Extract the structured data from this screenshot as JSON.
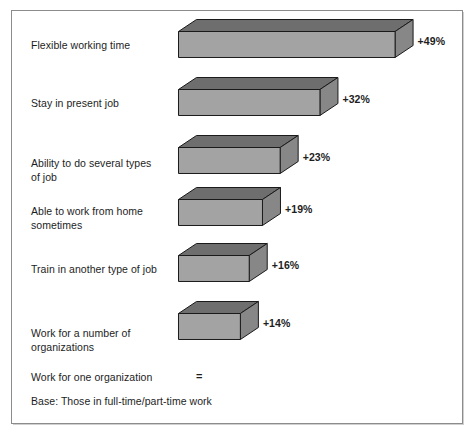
{
  "chart_data": {
    "type": "bar",
    "title": "",
    "subtitle": "",
    "xlabel": "",
    "ylabel": "",
    "orientation": "horizontal",
    "style": "3d-bar",
    "grid": false,
    "legend": null,
    "categories": [
      "Flexible working time",
      "Stay in present job",
      "Ability to do several types of job",
      "Able to work from home sometimes",
      "Train in another type of job",
      "Work for a number of organizations",
      "Work for one organization"
    ],
    "values": [
      49,
      32,
      23,
      19,
      16,
      14,
      0
    ],
    "value_labels": [
      "+49%",
      "+32%",
      "+23%",
      "+19%",
      "+16%",
      "+14%",
      "="
    ],
    "xlim": [
      0,
      49
    ],
    "annotations": [
      "Base: Those in full-time/part-time work"
    ],
    "colors": {
      "bar_front": "#a3a3a3",
      "bar_top": "#6e6e6e",
      "bar_side": "#878787",
      "bar_outline": "#1a1a1a",
      "frame": "#8c8c8c",
      "text": "#1d1d1d",
      "background": "#ffffff"
    }
  },
  "chart": {
    "base_note": "Base: Those in full-time/part-time work",
    "rows": [
      {
        "label": "Flexible working time",
        "label_lines": [
          "Flexible working time"
        ],
        "value_label": "+49%",
        "value": 49,
        "has_bar": true
      },
      {
        "label": "Stay in present job",
        "label_lines": [
          "Stay in present job"
        ],
        "value_label": "+32%",
        "value": 32,
        "has_bar": true
      },
      {
        "label": "Ability to do several types of job",
        "label_lines": [
          "Ability to do several types",
          "of job"
        ],
        "value_label": "+23%",
        "value": 23,
        "has_bar": true
      },
      {
        "label": "Able to work from home sometimes",
        "label_lines": [
          "Able to work from home",
          "sometimes"
        ],
        "value_label": "+19%",
        "value": 19,
        "has_bar": true
      },
      {
        "label": "Train in another type of job",
        "label_lines": [
          "Train in another type of job"
        ],
        "value_label": "+16%",
        "value": 16,
        "has_bar": true
      },
      {
        "label": "Work for a number of organizations",
        "label_lines": [
          "Work for a number of",
          "organizations"
        ],
        "value_label": "+14%",
        "value": 14,
        "has_bar": true
      },
      {
        "label": "Work for one organization",
        "label_lines": [
          "Work for one organization"
        ],
        "value_label": "=",
        "value": 0,
        "has_bar": false
      }
    ]
  }
}
